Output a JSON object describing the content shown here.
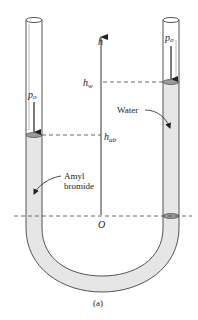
{
  "figure": {
    "caption": "(a)",
    "axis": {
      "label": "h",
      "origin_label": "O",
      "levels": [
        {
          "name": "h_w",
          "base": "h",
          "sub": "w"
        },
        {
          "name": "h_ab",
          "base": "h",
          "sub": "ab"
        }
      ]
    },
    "left_tube": {
      "pressure_label": {
        "base": "p",
        "sub": "o"
      },
      "fluid_label_line1": "Amyl",
      "fluid_label_line2": "bromide"
    },
    "right_tube": {
      "pressure_label": {
        "base": "p",
        "sub": "o"
      },
      "fluid_label": "Water"
    },
    "colors": {
      "fluid_fill": "#e6e6e6",
      "tube_stroke": "#555555",
      "disk_fill": "#9a9a9a",
      "dash": "#444444"
    }
  }
}
